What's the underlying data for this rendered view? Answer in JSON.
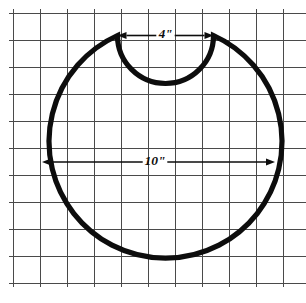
{
  "figure": {
    "background_color": "#ffffff",
    "outline_color": "#0d0d0d",
    "grid_color": "#4a4a4a",
    "width": 306,
    "height": 303
  },
  "grid": {
    "origin_x": 13,
    "origin_y": 13,
    "spacing": 27,
    "columns": 11,
    "rows": 10,
    "visible": true
  },
  "shape": {
    "name": "notched-circle",
    "circle": {
      "center_x": 158.5,
      "center_y": 153.5,
      "radius": 116.5
    },
    "notch": {
      "center_x": 165.5,
      "center_y": 35.5,
      "radius": 48,
      "left_cusp_x": 117.5,
      "right_cusp_x": 213.5,
      "cusp_y": 35.5
    }
  },
  "dimensions": [
    {
      "id": "notch-width",
      "label": "4\"",
      "value": 4,
      "unit": "inch",
      "orientation": "horizontal",
      "y": 35.5,
      "x_start": 117.5,
      "x_end": 213.5,
      "label_x": 165.5,
      "arrows": "outward"
    },
    {
      "id": "circle-diameter",
      "label": "10\"",
      "value": 10,
      "unit": "inch",
      "orientation": "horizontal",
      "y": 162,
      "x_start": 42,
      "x_end": 275,
      "label_x": 155,
      "arrows": "outward"
    }
  ]
}
